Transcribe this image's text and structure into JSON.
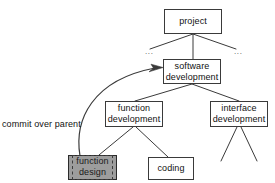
{
  "diagram": {
    "type": "tree-hierarchy",
    "background_color": "#ffffff",
    "line_color": "#3a3a3a",
    "selected_fill_color": "#9d9d9d",
    "nodes": [
      {
        "id": "project",
        "label_lines": [
          "project"
        ],
        "selected": false
      },
      {
        "id": "software-development",
        "label_lines": [
          "software",
          "development"
        ],
        "selected": false
      },
      {
        "id": "function-development",
        "label_lines": [
          "function",
          "development"
        ],
        "selected": false
      },
      {
        "id": "interface-development",
        "label_lines": [
          "interface",
          "development"
        ],
        "selected": false
      },
      {
        "id": "function-design",
        "label_lines": [
          "function",
          "design"
        ],
        "selected": true
      },
      {
        "id": "coding",
        "label_lines": [
          "coding"
        ],
        "selected": false
      }
    ],
    "ellipses": [
      {
        "id": "ellipsis-left",
        "text": "..."
      },
      {
        "id": "ellipsis-right",
        "text": "..."
      }
    ],
    "annotations": [
      {
        "id": "commit-over-parent",
        "text": "commit over parent"
      }
    ],
    "edges": [
      {
        "from": "project",
        "to": "ellipsis-left"
      },
      {
        "from": "project",
        "to": "software-development"
      },
      {
        "from": "project",
        "to": "ellipsis-right"
      },
      {
        "from": "software-development",
        "to": "function-development"
      },
      {
        "from": "software-development",
        "to": "interface-development"
      },
      {
        "from": "function-development",
        "to": "function-design"
      },
      {
        "from": "function-development",
        "to": "coding"
      },
      {
        "from": "interface-development",
        "to": "stub-left"
      },
      {
        "from": "interface-development",
        "to": "stub-right"
      }
    ],
    "arrow": {
      "id": "commit-arrow",
      "from": "function-design",
      "to": "software-development",
      "style": "curved-arrow"
    }
  }
}
